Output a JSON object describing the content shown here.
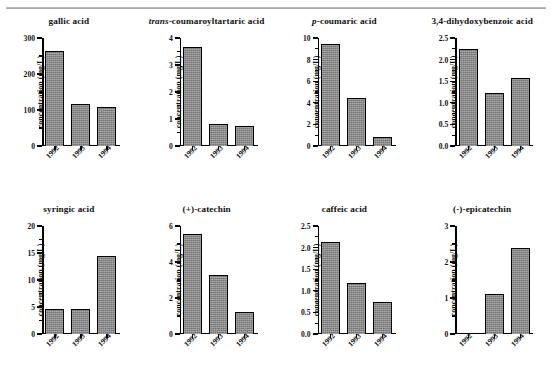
{
  "figure": {
    "categories": [
      "1992",
      "1993",
      "1994"
    ],
    "y_axis_title": "concentration (mg/L)",
    "bar_color": "#8d8d8d",
    "bar_edge_color": "#000000"
  },
  "chart_data": [
    {
      "type": "bar",
      "title": "gallic acid",
      "title_italic_prefix": "",
      "xlabel": "",
      "ylabel": "concentration (mg/L)",
      "categories": [
        "1992",
        "1993",
        "1994"
      ],
      "values": [
        263,
        117,
        108
      ],
      "ylim": [
        0,
        300
      ],
      "yticks": [
        0,
        100,
        200,
        300
      ],
      "ytick_labels": [
        "0",
        "100",
        "200",
        "300"
      ],
      "grid": false,
      "legend": "none"
    },
    {
      "type": "bar",
      "title": "-coumaroyltartaric acid",
      "title_italic_prefix": "trans",
      "xlabel": "",
      "ylabel": "concentration (mg/L)",
      "categories": [
        "1992",
        "1993",
        "1994"
      ],
      "values": [
        3.65,
        0.8,
        0.75
      ],
      "ylim": [
        0,
        4
      ],
      "yticks": [
        0,
        1,
        2,
        3,
        4
      ],
      "ytick_labels": [
        "0",
        "1",
        "2",
        "3",
        "4"
      ],
      "grid": false,
      "legend": "none"
    },
    {
      "type": "bar",
      "title": "-coumaric acid",
      "title_italic_prefix": "p",
      "xlabel": "",
      "ylabel": "concentration (mg/L)",
      "categories": [
        "1992",
        "1993",
        "1994"
      ],
      "values": [
        9.45,
        4.45,
        0.85
      ],
      "ylim": [
        0,
        10
      ],
      "yticks": [
        0,
        2,
        4,
        6,
        8,
        10
      ],
      "ytick_labels": [
        "0",
        "2",
        "4",
        "6",
        "8",
        "10"
      ],
      "grid": false,
      "legend": "none"
    },
    {
      "type": "bar",
      "title": "3,4-dihydoxybenzoic acid",
      "title_italic_prefix": "",
      "xlabel": "",
      "ylabel": "concentration (mg/L)",
      "categories": [
        "1992",
        "1993",
        "1994"
      ],
      "values": [
        2.25,
        1.23,
        1.57
      ],
      "ylim": [
        0,
        2.5
      ],
      "yticks": [
        0,
        0.5,
        1.0,
        1.5,
        2.0,
        2.5
      ],
      "ytick_labels": [
        "0.0",
        "0.5",
        "1.0",
        "1.5",
        "2.0",
        "2.5"
      ],
      "grid": false,
      "legend": "none"
    },
    {
      "type": "bar",
      "title": "syringic acid",
      "title_italic_prefix": "",
      "xlabel": "",
      "ylabel": "concentration (mg/L)",
      "categories": [
        "1992",
        "1993",
        "1994"
      ],
      "values": [
        4.6,
        4.6,
        14.5
      ],
      "ylim": [
        0,
        20
      ],
      "yticks": [
        0,
        5,
        10,
        15,
        20
      ],
      "ytick_labels": [
        "0",
        "5",
        "10",
        "15",
        "20"
      ],
      "grid": false,
      "legend": "none"
    },
    {
      "type": "bar",
      "title": "(+)-catechin",
      "title_italic_prefix": "",
      "xlabel": "",
      "ylabel": "concentration (mg/L)",
      "categories": [
        "1992",
        "1993",
        "1994"
      ],
      "values": [
        5.55,
        3.3,
        1.25
      ],
      "ylim": [
        0,
        6
      ],
      "yticks": [
        0,
        2,
        4,
        6
      ],
      "ytick_labels": [
        "0",
        "2",
        "4",
        "6"
      ],
      "grid": false,
      "legend": "none"
    },
    {
      "type": "bar",
      "title": "caffeic acid",
      "title_italic_prefix": "",
      "xlabel": "",
      "ylabel": "concentration (mg/L)",
      "categories": [
        "1992",
        "1993",
        "1994"
      ],
      "values": [
        2.12,
        1.17,
        0.75
      ],
      "ylim": [
        0,
        2.5
      ],
      "yticks": [
        0,
        0.5,
        1.0,
        1.5,
        2.0,
        2.5
      ],
      "ytick_labels": [
        "0.0",
        "0.5",
        "1.0",
        "1.5",
        "2.0",
        "2.5"
      ],
      "grid": false,
      "legend": "none"
    },
    {
      "type": "bar",
      "title": "(-)-epicatechin",
      "title_italic_prefix": "",
      "xlabel": "",
      "ylabel": "concentration (mg/L)",
      "categories": [
        "1992",
        "1993",
        "1994"
      ],
      "values": [
        0,
        1.1,
        2.4
      ],
      "ylim": [
        0,
        3
      ],
      "yticks": [
        0,
        1,
        2,
        3
      ],
      "ytick_labels": [
        "0",
        "1",
        "2",
        "3"
      ],
      "grid": false,
      "legend": "none"
    }
  ]
}
